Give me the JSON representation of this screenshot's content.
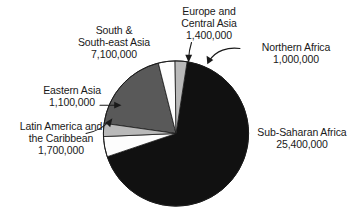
{
  "chart_data": {
    "type": "pie",
    "title": "",
    "subtitle": "",
    "xlabel": "",
    "ylabel": "",
    "grid": false,
    "legend_position": "callout-labels",
    "units": "people",
    "total": 37700000,
    "categories": [
      "Sub-Saharan Africa",
      "South & South-east Asia",
      "Latin America and the Caribbean",
      "Eastern Asia",
      "Europe and Central Asia",
      "Northern Africa"
    ],
    "values": [
      25400000,
      7100000,
      1700000,
      1100000,
      1400000,
      1000000
    ],
    "value_labels": [
      "25,400,000",
      "7,100,000",
      "1,700,000",
      "1,100,000",
      "1,400,000",
      "1,000,000"
    ],
    "slices": [
      {
        "name": "Sub-Saharan Africa",
        "label_line1": "Sub-Saharan Africa",
        "value": 25400000,
        "value_label": "25,400,000",
        "percent": 67.4,
        "angle_deg": 242.5,
        "color": "#111111",
        "start_deg": 23.0,
        "end_deg": 265.5
      },
      {
        "name": "South & South-east Asia",
        "label_line1": "South &",
        "label_line2": "South-east Asia",
        "value": 7100000,
        "value_label": "7,100,000",
        "percent": 18.8,
        "angle_deg": 67.8,
        "color": "#595959",
        "start_deg": 292.2,
        "end_deg": 360.0
      },
      {
        "name": "Latin America and the Caribbean",
        "label_line1": "Latin America and",
        "label_line2": "the Caribbean",
        "value": 1700000,
        "value_label": "1,700,000",
        "percent": 4.5,
        "angle_deg": 16.2,
        "color": "#fdfdfd",
        "start_deg": 6.8,
        "end_deg": 23.0
      },
      {
        "name": "Eastern Asia",
        "label_line1": "Eastern Asia",
        "value": 1100000,
        "value_label": "1,100,000",
        "percent": 2.9,
        "angle_deg": 10.5,
        "color": "#b9b9b9",
        "start_deg": 356.3,
        "end_deg": 6.8
      },
      {
        "name": "Europe and Central Asia",
        "label_line1": "Europe and",
        "label_line2": "Central Asia",
        "value": 1400000,
        "value_label": "1,400,000",
        "percent": 3.7,
        "angle_deg": 13.4,
        "color": "#fdfdfd",
        "start_deg": 278.8,
        "end_deg": 292.2
      },
      {
        "name": "Northern Africa",
        "label_line1": "Northern Africa",
        "value": 1000000,
        "value_label": "1,000,000",
        "percent": 2.7,
        "angle_deg": 9.6,
        "color": "#b9b9b9",
        "start_deg": 269.2,
        "end_deg": 278.8
      }
    ]
  },
  "labels": {
    "europe_central_asia": {
      "line1": "Europe and",
      "line2": "Central Asia",
      "value": "1,400,000"
    },
    "northern_africa": {
      "line1": "Northern Africa",
      "value": "1,000,000"
    },
    "south_southeast_asia": {
      "line1": "South &",
      "line2": "South-east Asia",
      "value": "7,100,000"
    },
    "eastern_asia": {
      "line1": "Eastern Asia",
      "value": "1,100,000"
    },
    "latin_america": {
      "line1": "Latin America and",
      "line2": "the Caribbean",
      "value": "1,700,000"
    },
    "subsaharan_africa": {
      "line1": "Sub-Saharan Africa",
      "value": "25,400,000"
    }
  },
  "colors": {
    "black_slice": "#111111",
    "dark_gray_slice": "#595959",
    "light_gray_slice": "#b9b9b9",
    "white_slice": "#fdfdfd",
    "outline": "#1a1a1a",
    "text": "#191919",
    "background": "#ffffff"
  }
}
